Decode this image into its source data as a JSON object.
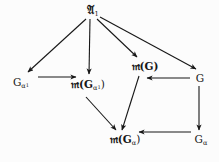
{
  "figure": {
    "kind": "commutative-diagram",
    "background_color": "#fcfcfc",
    "ink_color": "#171717",
    "width": 219,
    "height": 162
  },
  "nodes": [
    {
      "id": "top",
      "name": "node-script-a-1",
      "label": "𝔄₁",
      "base": "𝔄",
      "sub": "1",
      "subsub": "",
      "plain": "A_1",
      "x": 93,
      "y": 11
    },
    {
      "id": "galpha1",
      "name": "node-g-alpha-1",
      "label": "Gα₁",
      "base": "G",
      "sub": "α",
      "subsub": "1",
      "plain": "G_{alpha_1}",
      "x": 21,
      "y": 83
    },
    {
      "id": "mgalpha1",
      "name": "node-m-g-alpha-1",
      "label": "𝔪(Gα₁)",
      "base": "𝔪(G",
      "sub": "α",
      "subsub": "1",
      "close": ")",
      "plain": "m(G_{alpha_1})",
      "x": 88,
      "y": 85
    },
    {
      "id": "mg",
      "name": "node-m-g",
      "label": "𝔪(G)",
      "base": "𝔪(G)",
      "sub": "",
      "subsub": "",
      "plain": "m(G)",
      "x": 145,
      "y": 66
    },
    {
      "id": "g",
      "name": "node-g",
      "label": "G",
      "base": "G",
      "sub": "",
      "subsub": "",
      "plain": "G",
      "x": 200,
      "y": 78
    },
    {
      "id": "galpha",
      "name": "node-g-alpha",
      "label": "Gα",
      "base": "G",
      "sub": "α",
      "subsub": "",
      "plain": "G_alpha",
      "x": 201,
      "y": 140
    },
    {
      "id": "mgalpha",
      "name": "node-m-g-alpha",
      "label": "𝔪(Gα)",
      "base": "𝔪(G",
      "sub": "α",
      "subsub": "",
      "close": ")",
      "plain": "m(G_alpha)",
      "x": 125,
      "y": 140
    }
  ],
  "edges": [
    {
      "id": "e1",
      "name": "arrow-top-to-g-alpha-1",
      "from": "top",
      "to": "galpha1",
      "label": ""
    },
    {
      "id": "e2",
      "name": "arrow-top-to-m-g-alpha-1",
      "from": "top",
      "to": "mgalpha1",
      "label": ""
    },
    {
      "id": "e3",
      "name": "arrow-top-to-m-g",
      "from": "top",
      "to": "mg",
      "label": ""
    },
    {
      "id": "e4",
      "name": "arrow-top-to-g",
      "from": "top",
      "to": "g",
      "label": ""
    },
    {
      "id": "e5",
      "name": "arrow-g-alpha-1-to-m-g-alpha-1",
      "from": "galpha1",
      "to": "mgalpha1",
      "label": ""
    },
    {
      "id": "e6",
      "name": "arrow-g-to-m-g",
      "from": "g",
      "to": "mg",
      "label": ""
    },
    {
      "id": "e7",
      "name": "arrow-g-to-g-alpha",
      "from": "g",
      "to": "galpha",
      "label": ""
    },
    {
      "id": "e8",
      "name": "arrow-g-alpha-to-m-g-alpha",
      "from": "galpha",
      "to": "mgalpha",
      "label": ""
    },
    {
      "id": "e9",
      "name": "arrow-m-g-alpha-1-to-m-g-alpha",
      "from": "mgalpha1",
      "to": "mgalpha",
      "label": ""
    },
    {
      "id": "e10",
      "name": "arrow-m-g-to-m-g-alpha",
      "from": "mg",
      "to": "mgalpha",
      "label": ""
    }
  ]
}
